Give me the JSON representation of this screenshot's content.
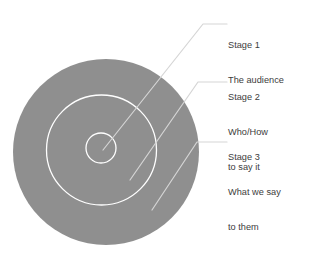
{
  "figure": {
    "type": "concentric-circles-target-diagram",
    "background_color": "#ffffff",
    "circle_fill_color": "#8f8f8f",
    "ring_stroke_color": "#ffffff",
    "leader_line_color": "#d5d5d5",
    "text_color": "#3c3c3c"
  },
  "circles": [
    {
      "name": "outer-circle",
      "cx": 106,
      "cy": 152,
      "r": 93
    },
    {
      "name": "middle-circle",
      "cx": 101.5,
      "cy": 150,
      "r": 55
    },
    {
      "name": "inner-circle",
      "cx": 101,
      "cy": 148,
      "r": 15
    }
  ],
  "labels": [
    {
      "id": "stage-1",
      "title": "Stage 1",
      "lines": [
        "The audience"
      ],
      "leader": {
        "start_x": 103,
        "start_y": 150,
        "bend_x": 203,
        "bend_y": 24,
        "end_x": 227,
        "end_y": 24
      }
    },
    {
      "id": "stage-2",
      "title": "Stage 2",
      "lines": [
        "Who/How",
        "to say it"
      ],
      "leader": {
        "start_x": 130,
        "start_y": 180,
        "bend_x": 198,
        "bend_y": 82,
        "end_x": 227,
        "end_y": 82
      }
    },
    {
      "id": "stage-3",
      "title": "Stage 3",
      "lines": [
        "What we say",
        "to them"
      ],
      "leader": {
        "start_x": 152,
        "start_y": 210,
        "bend_x": 197,
        "bend_y": 142,
        "end_x": 227,
        "end_y": 142
      }
    }
  ]
}
